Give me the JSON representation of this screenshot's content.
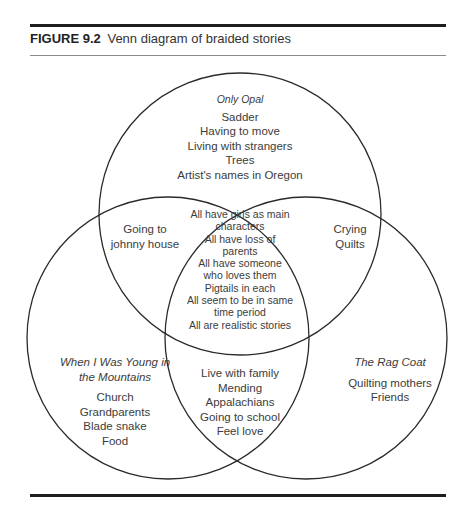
{
  "figure": {
    "number": "FIGURE 9.2",
    "title": "Venn diagram of braided stories"
  },
  "circles": [
    {
      "name": "Only Opal",
      "cx": 240,
      "cy": 214,
      "r": 141
    },
    {
      "name": "When I Was Young in the Mountains",
      "cx": 168,
      "cy": 338,
      "r": 141
    },
    {
      "name": "The Rag Coat",
      "cx": 306,
      "cy": 338,
      "r": 141
    }
  ],
  "regions": {
    "only_opal": {
      "label": "Only Opal",
      "items": [
        "Sadder",
        "Having to move",
        "Living with strangers",
        "Trees",
        "Artist's names in Oregon"
      ]
    },
    "opal_and_young": {
      "items": [
        "Going to",
        "johnny house"
      ]
    },
    "opal_and_ragcoat": {
      "items": [
        "Crying",
        "Quilts"
      ]
    },
    "all_three": {
      "items": [
        "All have girls as main",
        "characters",
        "All have loss of",
        "parents",
        "All have someone",
        "who loves them",
        "Pigtails in each",
        "All seem to be in same",
        "time period",
        "All are realistic stories"
      ]
    },
    "only_young": {
      "label_lines": [
        "When I Was Young in",
        "the Mountains"
      ],
      "items": [
        "Church",
        "Grandparents",
        "Blade snake",
        "Food"
      ]
    },
    "young_and_ragcoat": {
      "items": [
        "Live with family",
        "Mending",
        "Appalachians",
        "Going to school",
        "Feel love"
      ]
    },
    "only_ragcoat": {
      "label": "The Rag Coat",
      "items": [
        "Quilting mothers",
        "Friends"
      ]
    }
  },
  "colors": {
    "stroke": "#2a2a2a",
    "text": "#3c3c3c"
  }
}
